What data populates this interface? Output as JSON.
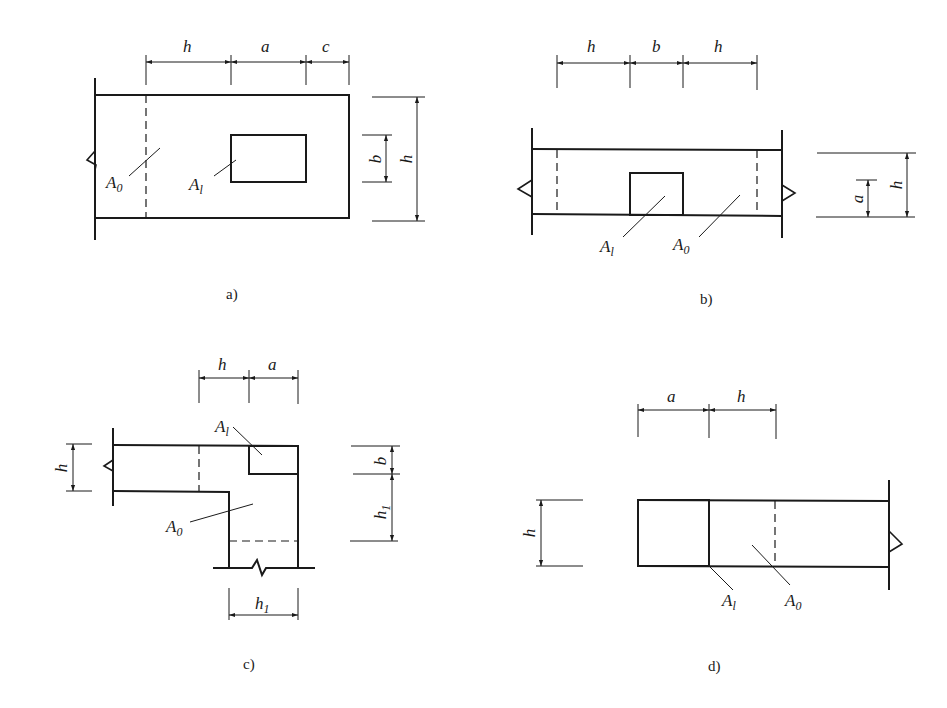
{
  "figure": {
    "panels": [
      {
        "id": "a",
        "caption": "a)",
        "top_dims": [
          "h",
          "a",
          "c"
        ],
        "side_dims": [
          "b",
          "h"
        ],
        "areas": {
          "loaded": "A",
          "loaded_sub": "l",
          "base": "A",
          "base_sub": "0"
        }
      },
      {
        "id": "b",
        "caption": "b)",
        "top_dims": [
          "h",
          "b",
          "h"
        ],
        "side_dims": [
          "a",
          "h"
        ],
        "areas": {
          "loaded": "A",
          "loaded_sub": "l",
          "base": "A",
          "base_sub": "0"
        }
      },
      {
        "id": "c",
        "caption": "c)",
        "top_dims": [
          "h",
          "a"
        ],
        "left_dims": [
          "h"
        ],
        "side_dims": [
          "b",
          "h",
          "1"
        ],
        "bottom_dims": [
          "h",
          "1"
        ],
        "areas": {
          "loaded": "A",
          "loaded_sub": "l",
          "base": "A",
          "base_sub": "0"
        }
      },
      {
        "id": "d",
        "caption": "d)",
        "top_dims": [
          "a",
          "h"
        ],
        "left_dims": [
          "h"
        ],
        "areas": {
          "loaded": "A",
          "loaded_sub": "l",
          "base": "A",
          "base_sub": "0"
        }
      }
    ]
  }
}
